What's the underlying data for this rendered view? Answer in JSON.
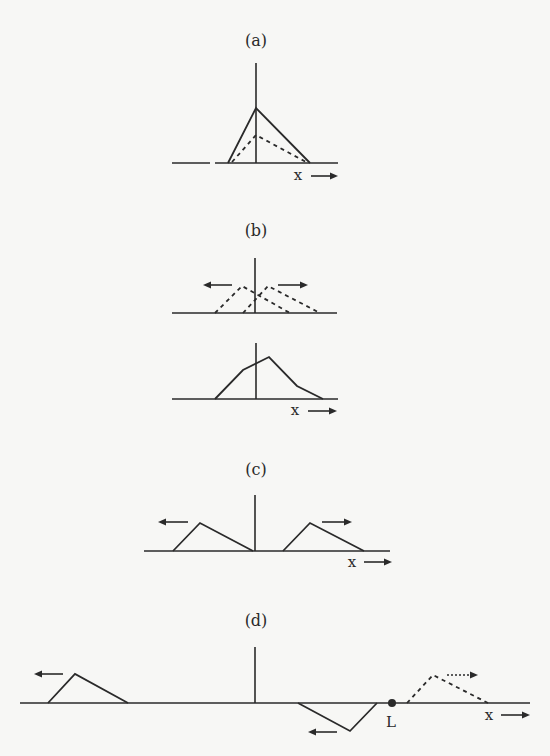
{
  "figure": {
    "colors": {
      "ink": "#2a2a2a",
      "background": "#f7f7f5"
    },
    "panels": [
      {
        "id": "a",
        "label": "(a)",
        "label_pos": [
          256,
          46
        ],
        "baseline": [
          [
            172,
            163
          ],
          [
            210,
            163
          ]
        ],
        "baseline2": [
          [
            215,
            163
          ],
          [
            338,
            163
          ]
        ],
        "vaxis": [
          256,
          63,
          163
        ],
        "solid_polylines": [
          [
            [
              228,
              163
            ],
            [
              256,
              108
            ],
            [
              310,
              163
            ]
          ]
        ],
        "dashed_polylines": [
          [
            [
              232,
              162
            ],
            [
              256,
              135
            ],
            [
              306,
              162
            ]
          ]
        ],
        "arrows": [],
        "points": [],
        "x_label": {
          "text": "x",
          "pos": [
            298,
            180
          ],
          "arrow": [
            [
              311,
              176
            ],
            [
              338,
              176
            ]
          ]
        }
      },
      {
        "id": "b-top",
        "label": "(b)",
        "label_pos": [
          256,
          236
        ],
        "baseline": [
          [
            172,
            313
          ],
          [
            337,
            313
          ]
        ],
        "vaxis": [
          255,
          258,
          313
        ],
        "solid_polylines": [],
        "dashed_polylines": [
          [
            [
              215,
              313
            ],
            [
              242,
              286
            ],
            [
              290,
              313
            ]
          ],
          [
            [
              243,
              313
            ],
            [
              268,
              286
            ],
            [
              320,
              313
            ]
          ]
        ],
        "arrows": [
          {
            "from": [
              232,
              285
            ],
            "to": [
              203,
              285
            ],
            "dashed": false
          },
          {
            "from": [
              278,
              285
            ],
            "to": [
              308,
              285
            ],
            "dashed": false
          }
        ],
        "points": [],
        "x_label": null
      },
      {
        "id": "b-bottom",
        "label": "",
        "label_pos": null,
        "baseline": [
          [
            172,
            399
          ],
          [
            338,
            399
          ]
        ],
        "vaxis": [
          256,
          343,
          399
        ],
        "solid_polylines": [
          [
            [
              215,
              399
            ],
            [
              243,
              370
            ],
            [
              269,
              357
            ],
            [
              297,
              386
            ],
            [
              323,
              399
            ]
          ]
        ],
        "dashed_polylines": [],
        "arrows": [],
        "points": [],
        "x_label": {
          "text": "x",
          "pos": [
            295,
            415
          ],
          "arrow": [
            [
              308,
              411
            ],
            [
              337,
              411
            ]
          ]
        }
      },
      {
        "id": "c",
        "label": "(c)",
        "label_pos": [
          256,
          475
        ],
        "baseline": [
          [
            144,
            551
          ],
          [
            390,
            551
          ]
        ],
        "vaxis": [
          255,
          495,
          551
        ],
        "solid_polylines": [
          [
            [
              173,
              551
            ],
            [
              200,
              523
            ],
            [
              253,
              551
            ]
          ],
          [
            [
              283,
              551
            ],
            [
              310,
              523
            ],
            [
              364,
              551
            ]
          ]
        ],
        "dashed_polylines": [],
        "arrows": [
          {
            "from": [
              188,
              522
            ],
            "to": [
              158,
              522
            ],
            "dashed": false
          },
          {
            "from": [
              322,
              522
            ],
            "to": [
              352,
              522
            ],
            "dashed": false
          }
        ],
        "points": [],
        "x_label": {
          "text": "x",
          "pos": [
            352,
            567
          ],
          "arrow": [
            [
              364,
              562
            ],
            [
              392,
              562
            ]
          ]
        }
      },
      {
        "id": "d",
        "label": "(d)",
        "label_pos": [
          256,
          626
        ],
        "baseline": [
          [
            20,
            703
          ],
          [
            530,
            703
          ]
        ],
        "vaxis": [
          255,
          647,
          703
        ],
        "solid_polylines": [
          [
            [
              48,
              703
            ],
            [
              75,
              674
            ],
            [
              128,
              703
            ]
          ],
          [
            [
              298,
              703
            ],
            [
              350,
              731
            ],
            [
              377,
              703
            ]
          ]
        ],
        "dashed_polylines": [
          [
            [
              407,
              703
            ],
            [
              433,
              675
            ],
            [
              488,
              703
            ]
          ]
        ],
        "arrows": [
          {
            "from": [
              63,
              674
            ],
            "to": [
              34,
              674
            ],
            "dashed": false
          },
          {
            "from": [
              337,
              732
            ],
            "to": [
              308,
              732
            ],
            "dashed": false
          },
          {
            "from": [
              447,
              675
            ],
            "to": [
              478,
              675
            ],
            "dashed": true
          }
        ],
        "points": [
          {
            "pos": [
              392,
              703
            ],
            "r": 4,
            "label": "L",
            "label_pos": [
              391,
              727
            ]
          }
        ],
        "x_label": {
          "text": "x",
          "pos": [
            489,
            720
          ],
          "arrow": [
            [
              501,
              715
            ],
            [
              530,
              715
            ]
          ]
        }
      }
    ]
  }
}
